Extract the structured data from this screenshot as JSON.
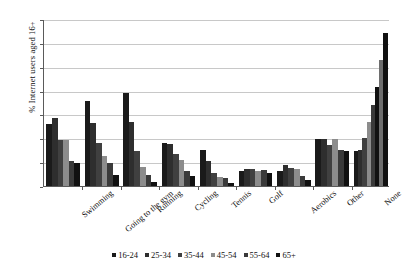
{
  "chart_data": {
    "type": "bar",
    "title": "",
    "subtitle": "",
    "xlabel": "",
    "ylabel": "% Internet users aged 16+",
    "ylim": [
      0,
      70
    ],
    "ytick_step": 10,
    "yticks": [
      0,
      10,
      20,
      30,
      40,
      50,
      60,
      70
    ],
    "grid": "horizontal",
    "legend_position": "bottom-center",
    "categories": [
      "Swimming",
      "Going to the gym",
      "Running",
      "Cycling",
      "Tennis",
      "Golf",
      "Aerobics",
      "Other",
      "None"
    ],
    "series": [
      {
        "name": "16-24",
        "color": "#1a1a1a",
        "values": [
          26,
          35.5,
          38.8,
          18.2,
          15,
          6.2,
          6.2,
          19.5,
          14.5
        ]
      },
      {
        "name": "25-34",
        "color": "#2e2e2e",
        "values": [
          28.5,
          26.5,
          27,
          17.8,
          10.5,
          7,
          8.8,
          19.5,
          15
        ]
      },
      {
        "name": "35-44",
        "color": "#404040",
        "values": [
          19.2,
          18.2,
          14.5,
          13.5,
          5.5,
          7.2,
          7.5,
          17,
          20
        ]
      },
      {
        "name": "45-54",
        "color": "#8c8c8c",
        "values": [
          19.2,
          12.5,
          8,
          11,
          3.8,
          6.5,
          7,
          19.5,
          27
        ]
      },
      {
        "name": "55-64",
        "color": "#3a3a3a",
        "values": [
          10.5,
          9.8,
          4.8,
          6.5,
          3.2,
          6.8,
          4.2,
          15,
          34
        ]
      },
      {
        "name": "65+",
        "color": "#111111",
        "values": [
          9.5,
          4.5,
          1.8,
          4,
          1.2,
          5.5,
          2.5,
          14.5,
          41.5
        ]
      }
    ],
    "extra_bars_none": [
      53,
      64
    ]
  },
  "legend": {
    "items": [
      "16-24",
      "25-34",
      "35-44",
      "45-54",
      "55-64",
      "65+"
    ]
  }
}
